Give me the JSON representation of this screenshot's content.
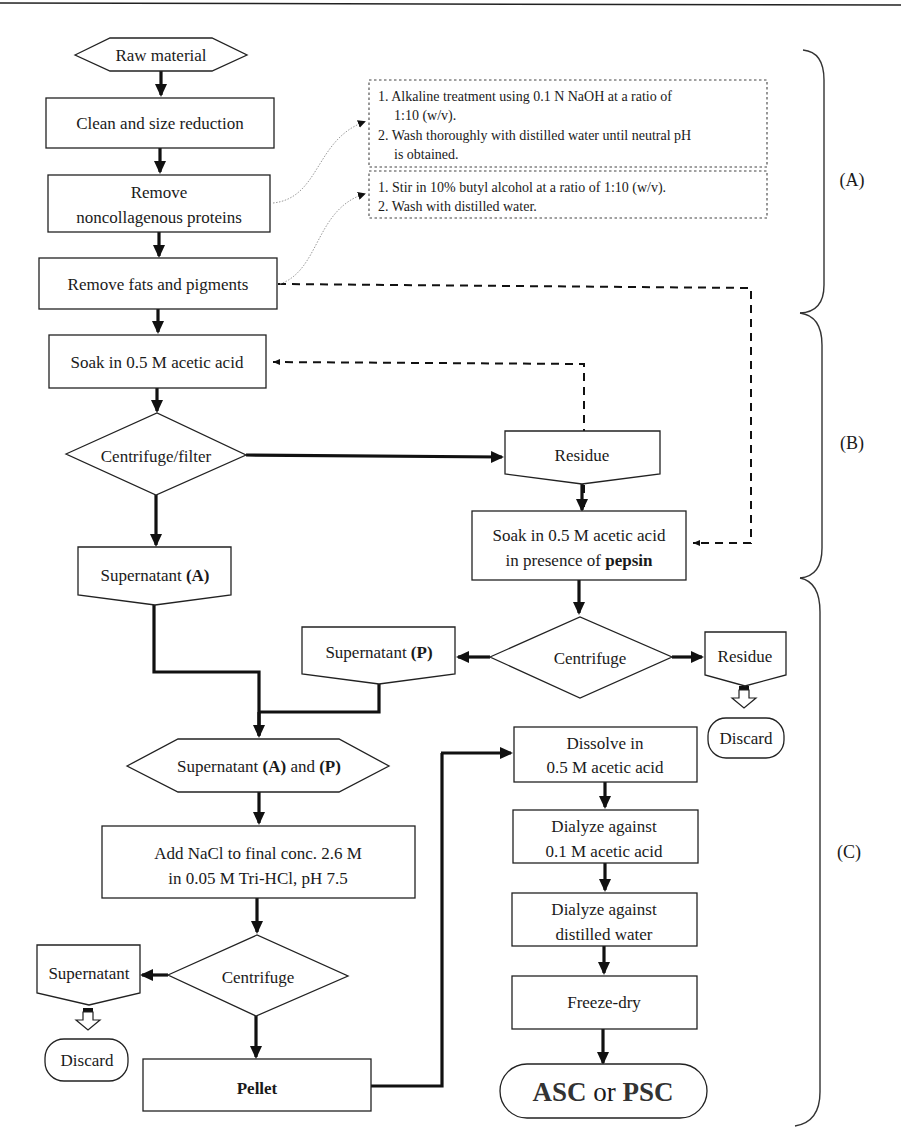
{
  "figure": {
    "type": "flowchart"
  },
  "nodes": {
    "raw_material": "Raw material",
    "clean": "Clean and size reduction",
    "remove_ncp_1": "Remove",
    "remove_ncp_2": "noncollagenous proteins",
    "remove_fats": "Remove fats and pigments",
    "soak_acetic": "Soak in 0.5 M acetic acid",
    "centrifuge_filter": "Centrifuge/filter",
    "residue_1": "Residue",
    "soak_pepsin_1": "Soak in 0.5 M acetic acid",
    "soak_pepsin_2a": "in presence of ",
    "soak_pepsin_2b": "pepsin",
    "supernatant_a_1": "Supernatant ",
    "supernatant_a_2": "(A)",
    "centrifuge_2": "Centrifuge",
    "supernatant_p_1": "Supernatant ",
    "supernatant_p_2": "(P)",
    "residue_2": "Residue",
    "discard_1": "Discard",
    "combined_1": "Supernatant ",
    "combined_2": "(A)",
    "combined_3": " and ",
    "combined_4": "(P)",
    "add_nacl_1": "Add NaCl to final conc. 2.6 M",
    "add_nacl_2": "in 0.05 M Tri-HCl, pH 7.5",
    "centrifuge_3": "Centrifuge",
    "supernatant_3": "Supernatant",
    "discard_2": "Discard",
    "pellet": "Pellet",
    "dissolve_1": "Dissolve in",
    "dissolve_2": "0.5 M acetic acid",
    "dialyze_acid_1": "Dialyze against",
    "dialyze_acid_2": "0.1 M acetic acid",
    "dialyze_water_1": "Dialyze against",
    "dialyze_water_2": "distilled water",
    "freeze_dry": "Freeze-dry",
    "final_1": "ASC",
    "final_2": " or ",
    "final_3": "PSC"
  },
  "notes": {
    "alkaline": [
      "1. Alkaline treatment using 0.1 N NaOH at a ratio of",
      "1:10 (w/v).",
      "2. Wash thoroughly with distilled water until neutral pH",
      "is obtained."
    ],
    "butyl": [
      "1. Stir in 10% butyl alcohol at a ratio of 1:10 (w/v).",
      "2. Wash with distilled water."
    ]
  },
  "sections": {
    "a": "(A)",
    "b": "(B)",
    "c": "(C)"
  }
}
